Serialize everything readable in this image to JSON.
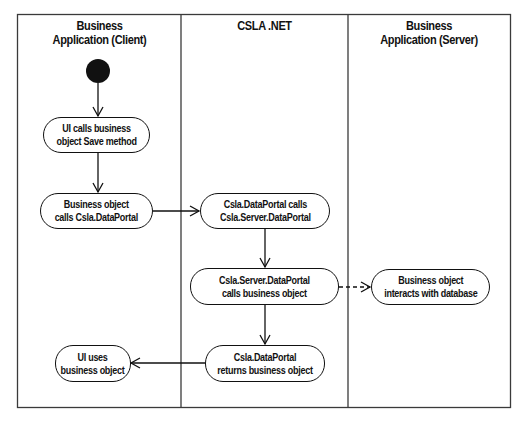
{
  "diagram": {
    "type": "UML activity diagram with swimlanes",
    "lanes": [
      {
        "id": "client",
        "title_line1": "Business",
        "title_line2": "Application (Client)"
      },
      {
        "id": "csla",
        "title_line1": "CSLA .NET",
        "title_line2": ""
      },
      {
        "id": "server",
        "title_line1": "Business",
        "title_line2": "Application (Server)"
      }
    ],
    "start_node": {
      "lane": "client",
      "shape": "filled-circle"
    },
    "nodes": [
      {
        "id": "n1",
        "lane": "client",
        "label": "UI calls business\nobject Save method"
      },
      {
        "id": "n2",
        "lane": "client",
        "label": "Business object\ncalls Csla.DataPortal"
      },
      {
        "id": "n3",
        "lane": "csla",
        "label": "Csla.DataPortal calls\nCsla.Server.DataPortal"
      },
      {
        "id": "n4",
        "lane": "csla",
        "label": "Csla.Server.DataPortal\ncalls business object"
      },
      {
        "id": "n5",
        "lane": "server",
        "label": "Business object\ninteracts with database"
      },
      {
        "id": "n6",
        "lane": "csla",
        "label": "Csla.DataPortal\nreturns business object"
      },
      {
        "id": "n7",
        "lane": "client",
        "label": "UI uses\nbusiness object"
      }
    ],
    "edges": [
      {
        "from": "start",
        "to": "n1",
        "style": "solid"
      },
      {
        "from": "n1",
        "to": "n2",
        "style": "solid"
      },
      {
        "from": "n2",
        "to": "n3",
        "style": "solid"
      },
      {
        "from": "n3",
        "to": "n4",
        "style": "solid"
      },
      {
        "from": "n4",
        "to": "n5",
        "style": "dashed"
      },
      {
        "from": "n4",
        "to": "n6",
        "style": "solid"
      },
      {
        "from": "n6",
        "to": "n7",
        "style": "solid"
      }
    ],
    "colors": {
      "stroke": "#111111",
      "frame": "#3a3a3a",
      "background": "#ffffff"
    }
  }
}
